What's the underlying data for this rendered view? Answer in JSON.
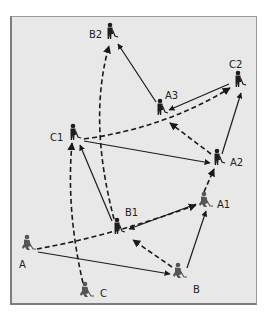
{
  "diagram": {
    "type": "field hockey passing drill",
    "colors": {
      "background": "#e8e8e8",
      "border": "#7d7d7d",
      "line": "#1a1a1a",
      "figure": "#1e1e1e",
      "figure_light": "#555555"
    },
    "players": [
      {
        "id": "A",
        "label": "A",
        "x": 27,
        "y": 243,
        "lx": 19,
        "ly": 268
      },
      {
        "id": "B",
        "label": "B",
        "x": 178,
        "y": 271,
        "lx": 193,
        "ly": 293
      },
      {
        "id": "C",
        "label": "C",
        "x": 85,
        "y": 290,
        "lx": 100,
        "ly": 297
      },
      {
        "id": "A1",
        "label": "A1",
        "x": 204,
        "y": 200,
        "lx": 217,
        "ly": 208
      },
      {
        "id": "B1",
        "label": "B1",
        "x": 117,
        "y": 227,
        "lx": 125,
        "ly": 216
      },
      {
        "id": "C1",
        "label": "C1",
        "x": 73,
        "y": 133,
        "lx": 50,
        "ly": 141
      },
      {
        "id": "A2",
        "label": "A2",
        "x": 217,
        "y": 158,
        "lx": 230,
        "ly": 166
      },
      {
        "id": "A3",
        "label": "A3",
        "x": 160,
        "y": 108,
        "lx": 165,
        "ly": 99
      },
      {
        "id": "B2",
        "label": "B2",
        "x": 110,
        "y": 32,
        "lx": 89,
        "ly": 38
      },
      {
        "id": "C2",
        "label": "C2",
        "x": 238,
        "y": 80,
        "lx": 229,
        "ly": 68
      }
    ],
    "paths": [
      {
        "from": "A",
        "to": "A1",
        "style": "dashed",
        "meaning": "player run",
        "d": "M37,249 Q110,236 196,205"
      },
      {
        "from": "A",
        "to": "B",
        "style": "solid",
        "meaning": "pass",
        "d": "M38,252 L170,274"
      },
      {
        "from": "C",
        "to": "C1",
        "style": "dashed",
        "meaning": "player run",
        "d": "M83,283 Q66,210 72,143"
      },
      {
        "from": "B1",
        "to": "C1",
        "style": "solid",
        "meaning": "pass",
        "d": "M112,221 L80,145"
      },
      {
        "from": "B1",
        "to": "B2",
        "style": "dashed",
        "meaning": "player run",
        "d": "M114,219 Q88,120 109,46"
      },
      {
        "from": "A3",
        "to": "B2",
        "style": "solid",
        "meaning": "pass",
        "d": "M156,102 L118,44"
      },
      {
        "from": "C1",
        "to": "C2",
        "style": "dashed",
        "meaning": "player run",
        "d": "M84,139 Q165,128 230,88"
      },
      {
        "from": "C1",
        "to": "A2",
        "style": "solid",
        "meaning": "pass",
        "d": "M84,141 L210,163"
      },
      {
        "from": "A2",
        "to": "A3",
        "style": "dashed",
        "meaning": "player run",
        "d": "M211,154 L170,123"
      },
      {
        "from": "C2",
        "to": "A3",
        "style": "solid",
        "meaning": "pass",
        "d": "M229,84 L169,110"
      },
      {
        "from": "A2",
        "to": "C2",
        "style": "solid",
        "meaning": "pass",
        "d": "M222,154 L241,93"
      },
      {
        "from": "A1",
        "to": "A2",
        "style": "dashed",
        "meaning": "player run",
        "d": "M204,192 L214,169"
      },
      {
        "from": "A1",
        "to": "B1",
        "style": "solid",
        "meaning": "pass",
        "d": "M196,204 L129,229"
      },
      {
        "from": "B",
        "to": "B1",
        "style": "dashed",
        "meaning": "player run",
        "d": "M172,267 L133,240"
      },
      {
        "from": "B",
        "to": "A1",
        "style": "solid",
        "meaning": "pass",
        "d": "M187,268 L206,211"
      }
    ]
  }
}
